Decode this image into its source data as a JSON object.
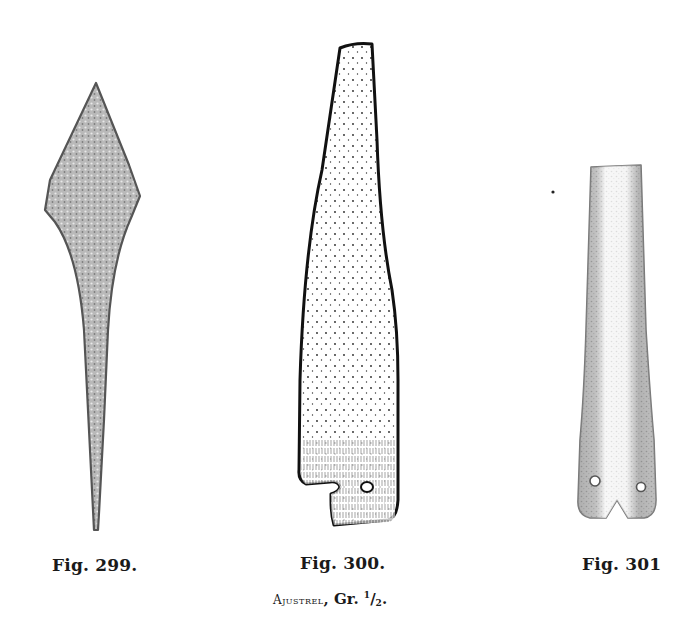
{
  "figures": [
    {
      "id": "fig-299",
      "label": "Fig. 299.",
      "description": "bone point, lozenge-shaped head with long tapering shank"
    },
    {
      "id": "fig-300",
      "label": "Fig. 300.",
      "description": "flat tapering bone tool with notch and perforation at base"
    },
    {
      "id": "fig-301",
      "label": "Fig. 301",
      "description": "bone tube/handle with two perforations and notched base"
    }
  ],
  "plate": {
    "site": "Ajustrel",
    "scale_prefix": "Gr.",
    "scale_num": "1",
    "scale_den": "2",
    "scale_suffix": "."
  },
  "colors": {
    "paper": "#ffffff",
    "ink": "#111111",
    "stipple_gray": "#8a8a8a"
  }
}
